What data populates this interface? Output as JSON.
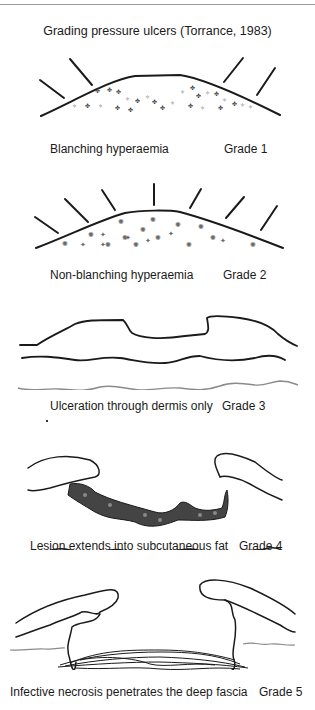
{
  "figure": {
    "title": "Grading pressure ulcers (Torrance, 1983)",
    "grades": [
      {
        "description": "Blanching hyperaemia",
        "grade": "Grade 1"
      },
      {
        "description": "Non-blanching hyperaemia",
        "grade": "Grade 2"
      },
      {
        "description": "Ulceration through dermis only",
        "grade": "Grade 3"
      },
      {
        "description": "Lesion extends into subcutaneous fat",
        "grade": "Grade 4"
      },
      {
        "description": "Infective necrosis penetrates the deep fascia",
        "grade": "Grade 5"
      }
    ]
  },
  "colors": {
    "line": "#1a1a1a",
    "grey_line": "#8a8a8a",
    "lesion": "#3a3a3a"
  }
}
